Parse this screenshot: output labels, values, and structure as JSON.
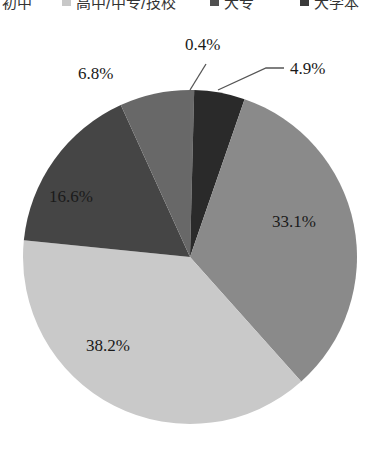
{
  "legend": {
    "items": [
      {
        "label": "初中",
        "color": "#ffffff",
        "x": 2,
        "swatch": false
      },
      {
        "label": "高中/中专/技校",
        "color": "#c8c8c8",
        "x": 62,
        "swatch": true
      },
      {
        "label": "大专",
        "color": "#505050",
        "x": 210,
        "swatch": true
      },
      {
        "label": "大学本",
        "color": "#3a3a3a",
        "x": 300,
        "swatch": true
      }
    ]
  },
  "chart_data": {
    "type": "pie",
    "title": "",
    "start_angle_deg": 0,
    "direction": "clockwise",
    "center": [
      190,
      257
    ],
    "radius": 167,
    "slices": [
      {
        "label": "0.4%",
        "value": 0.4,
        "color": "#6a6a6a"
      },
      {
        "label": "4.9%",
        "value": 4.9,
        "color": "#2a2a2a"
      },
      {
        "label": "33.1%",
        "value": 33.1,
        "color": "#8a8a8a"
      },
      {
        "label": "38.2%",
        "value": 38.2,
        "color": "#c9c9c9"
      },
      {
        "label": "16.6%",
        "value": 16.6,
        "color": "#454545"
      },
      {
        "label": "6.8%",
        "value": 6.8,
        "color": "#686868"
      }
    ],
    "legend_entries": [
      "初中",
      "高中/中专/技校",
      "大专",
      "大学本科"
    ],
    "legend_position": "top"
  },
  "labels": {
    "s0": {
      "text": "0.4%",
      "x": 185,
      "y": 36
    },
    "s1": {
      "text": "4.9%",
      "x": 290,
      "y": 60
    },
    "s2": {
      "text": "33.1%",
      "x": 272,
      "y": 213
    },
    "s3": {
      "text": "38.2%",
      "x": 86,
      "y": 337
    },
    "s4": {
      "text": "16.6%",
      "x": 49,
      "y": 188
    },
    "s5": {
      "text": "6.8%",
      "x": 78,
      "y": 65
    }
  }
}
